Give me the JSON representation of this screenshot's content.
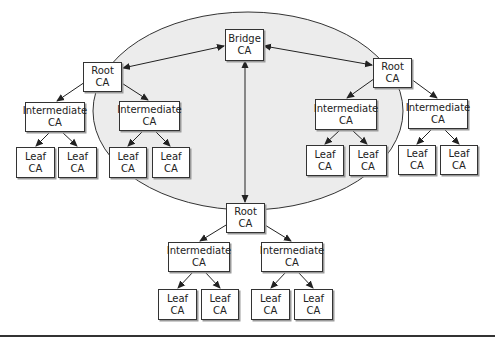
{
  "diagram": {
    "type": "bridge-ca-pki-topology",
    "colors": {
      "ellipse_fill": "#ececec",
      "line": "#333333",
      "box_border": "#333333",
      "background": "#ffffff"
    },
    "bridge": {
      "line1": "Bridge",
      "line2": "CA"
    },
    "hierarchies": [
      {
        "root": {
          "line1": "Root",
          "line2": "CA"
        },
        "intermediates": [
          {
            "line1": "Intermediate",
            "line2": "CA",
            "leaves": [
              {
                "line1": "Leaf",
                "line2": "CA"
              },
              {
                "line1": "Leaf",
                "line2": "CA"
              }
            ]
          },
          {
            "line1": "Intermediate",
            "line2": "CA",
            "leaves": [
              {
                "line1": "Leaf",
                "line2": "CA"
              },
              {
                "line1": "Leaf",
                "line2": "CA"
              }
            ]
          }
        ]
      },
      {
        "root": {
          "line1": "Root",
          "line2": "CA"
        },
        "intermediates": [
          {
            "line1": "Intermediate",
            "line2": "CA",
            "leaves": [
              {
                "line1": "Leaf",
                "line2": "CA"
              },
              {
                "line1": "Leaf",
                "line2": "CA"
              }
            ]
          },
          {
            "line1": "Intermediate",
            "line2": "CA",
            "leaves": [
              {
                "line1": "Leaf",
                "line2": "CA"
              },
              {
                "line1": "Leaf",
                "line2": "CA"
              }
            ]
          }
        ]
      },
      {
        "root": {
          "line1": "Root",
          "line2": "CA"
        },
        "intermediates": [
          {
            "line1": "Intermediate",
            "line2": "CA",
            "leaves": [
              {
                "line1": "Leaf",
                "line2": "CA"
              },
              {
                "line1": "Leaf",
                "line2": "CA"
              }
            ]
          },
          {
            "line1": "Intermediate",
            "line2": "CA",
            "leaves": [
              {
                "line1": "Leaf",
                "line2": "CA"
              },
              {
                "line1": "Leaf",
                "line2": "CA"
              }
            ]
          }
        ]
      }
    ]
  }
}
